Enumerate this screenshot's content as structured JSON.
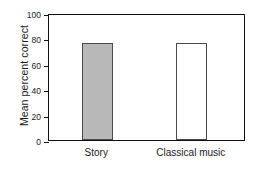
{
  "chart_data": {
    "type": "bar",
    "title": "",
    "xlabel": "",
    "ylabel": "Mean percent correct",
    "categories": [
      "Story",
      "Classical music"
    ],
    "values": [
      76.5,
      76.5
    ],
    "ylim": [
      0,
      100
    ],
    "yticks": [
      0,
      20,
      40,
      60,
      80,
      100
    ],
    "ytick_labels": [
      "0",
      "20",
      "40",
      "60",
      "80",
      "100"
    ],
    "grid": false,
    "legend": false,
    "series": [
      {
        "name": "Mean percent correct",
        "values": [
          76.5,
          76.5
        ],
        "bar_styles": [
          {
            "fill": "#b8b8b8",
            "edge": "#4a4a4a"
          },
          {
            "fill": "#ffffff",
            "edge": "#4a4a4a"
          }
        ]
      }
    ]
  },
  "colors": {
    "axis": "#111111",
    "text": "#1a1a1a",
    "bar_filled": "#b8b8b8",
    "bar_open": "#ffffff",
    "bar_edge": "#4a4a4a",
    "background": "#ffffff"
  }
}
